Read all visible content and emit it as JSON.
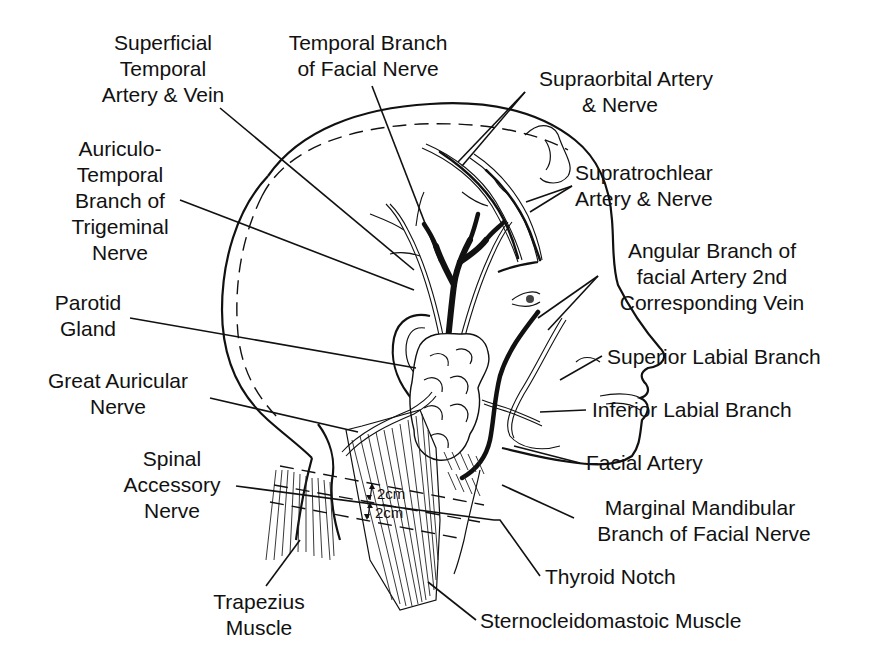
{
  "figure": {
    "background": "#ffffff",
    "ink_color": "#111111"
  },
  "labels": {
    "superficial_temporal": [
      "Superficial",
      "Temporal",
      "Artery & Vein"
    ],
    "temporal_branch_facial": [
      "Temporal Branch",
      "of Facial Nerve"
    ],
    "supraorbital": [
      "Supraorbital Artery",
      "& Nerve"
    ],
    "auriculotemporal": [
      "Auriculo-",
      "Temporal",
      "Branch of",
      "Trigeminal",
      "Nerve"
    ],
    "supratrochlear": [
      "Supratrochlear",
      "Artery & Nerve"
    ],
    "angular_branch": [
      "Angular Branch of",
      "facial Artery 2nd",
      "Corresponding Vein"
    ],
    "parotid": [
      "Parotid",
      "Gland"
    ],
    "superior_labial": [
      "Superior Labial Branch"
    ],
    "great_auricular": [
      "Great Auricular",
      "Nerve"
    ],
    "inferior_labial": [
      "Inferior Labial Branch"
    ],
    "spinal_accessory": [
      "Spinal",
      "Accessory",
      "Nerve"
    ],
    "facial_artery": [
      "Facial Artery"
    ],
    "marginal_mandibular": [
      "Marginal Mandibular",
      "Branch of Facial Nerve"
    ],
    "thyroid_notch": [
      "Thyroid Notch"
    ],
    "trapezius": [
      "Trapezius",
      "Muscle"
    ],
    "sternocleidomastoid": [
      "Sternocleidomastoic Muscle"
    ]
  },
  "measurements": {
    "upper": "2cm",
    "lower": "2cm"
  }
}
